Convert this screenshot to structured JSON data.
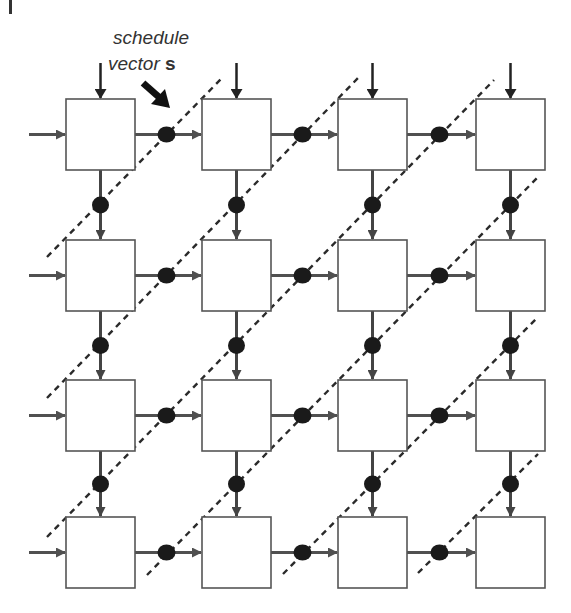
{
  "annotation": {
    "line1": "schedule",
    "line2_prefix": "vector ",
    "line2_symbol": "s"
  },
  "grid": {
    "rows": 4,
    "cols": 4,
    "col_x": [
      66,
      202,
      338,
      476
    ],
    "row_y": [
      99,
      240,
      380,
      517
    ],
    "cell_w": 69,
    "cell_h": 71
  },
  "colors": {
    "box_stroke": "#555555",
    "h_arrow": "#505050",
    "v_arrow": "#444444",
    "input_arrow": "#222222",
    "delay_dot": "#1a1a1a",
    "dashed_line": "#2a2a2a",
    "schedule_arrow": "#111111"
  },
  "elements": {
    "cells": "processing elements (PE) in a 4x4 systolic array",
    "delays": "delay registers on every inter-PE link",
    "hyperplanes": "dashed equitemporal hyperplanes perpendicular to schedule vector s"
  }
}
